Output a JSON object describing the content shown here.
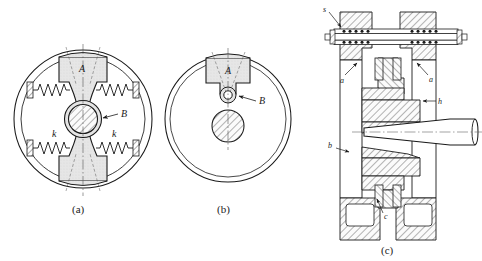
{
  "figure": {
    "background_color": "#ffffff",
    "line_color": "#1a1a1a",
    "fill_light": "#e2e2e2",
    "fill_hatch": "#f2f2f2",
    "panels": [
      {
        "id": "a",
        "caption": "(a)",
        "description": "Front view: rotor disc with hourglass-shaped carrier, central hatched hub and four coil springs to the housing walls",
        "labels": [
          {
            "name": "A",
            "text": "A",
            "role": "carrier-body"
          },
          {
            "name": "B",
            "text": "B",
            "role": "central-hub"
          },
          {
            "name": "k-left",
            "text": "k",
            "role": "spring-stiffness"
          },
          {
            "name": "k-right",
            "text": "k",
            "role": "spring-stiffness"
          }
        ],
        "spring_count": 4,
        "spring_label": "k"
      },
      {
        "id": "b",
        "caption": "(b)",
        "description": "Front view variant: plain disc with T-shaped block A, small pivot circle B and a separate hatched circle below",
        "labels": [
          {
            "name": "A",
            "text": "A",
            "role": "t-block"
          },
          {
            "name": "B",
            "text": "B",
            "role": "pivot-pin"
          }
        ]
      },
      {
        "id": "c",
        "caption": "(c)",
        "description": "Sectional assembly view: housing with two ball-bearing rows at top, tapered shaft entering from the right",
        "labels": [
          {
            "name": "s",
            "text": "s",
            "role": "bearing-seal"
          },
          {
            "name": "a-left",
            "text": "a",
            "role": "housing-wall"
          },
          {
            "name": "a-right",
            "text": "a",
            "role": "housing-wall"
          },
          {
            "name": "h",
            "text": "h",
            "role": "hub-shoulder"
          },
          {
            "name": "b",
            "text": "b",
            "role": "lower-flange"
          },
          {
            "name": "c",
            "text": "c",
            "role": "clamp-bolt"
          }
        ],
        "bearing_rows": 4,
        "balls_per_row": 5
      }
    ]
  }
}
